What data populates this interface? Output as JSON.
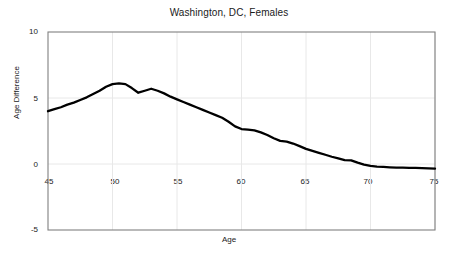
{
  "chart_data": {
    "type": "line",
    "title": "Washington, DC, Females",
    "xlabel": "Age",
    "ylabel": "Age Difference",
    "xlim": [
      45,
      75
    ],
    "ylim": [
      -5,
      10
    ],
    "grid": true,
    "legend": "none",
    "xticks": [
      "45",
      "50",
      "55",
      "60",
      "65",
      "70",
      "75"
    ],
    "xtick_values": [
      45,
      50,
      55,
      60,
      65,
      70,
      75
    ],
    "yticks": [
      "10",
      "5",
      "0",
      "-5"
    ],
    "ytick_values": [
      10,
      5,
      0,
      -5
    ],
    "line_color": "#000000",
    "grid_color": "#e8e8e8",
    "frame_color": "#808080",
    "series": [
      {
        "name": "Age Difference",
        "x": [
          45,
          45.5,
          46,
          46.5,
          47,
          47.5,
          48,
          48.5,
          49,
          49.5,
          50,
          50.5,
          51,
          51.5,
          52,
          52.5,
          53,
          53.5,
          54,
          54.5,
          55,
          55.5,
          56,
          56.5,
          57,
          57.5,
          58,
          58.5,
          59,
          59.5,
          60,
          60.5,
          61,
          61.5,
          62,
          62.5,
          63,
          63.5,
          64,
          64.5,
          65,
          65.5,
          66,
          66.5,
          67,
          67.5,
          68,
          68.5,
          69,
          69.5,
          70,
          70.5,
          71,
          71.5,
          72,
          72.5,
          73,
          73.5,
          74,
          74.5,
          75
        ],
        "y": [
          4.0,
          4.15,
          4.3,
          4.5,
          4.65,
          4.85,
          5.05,
          5.3,
          5.55,
          5.85,
          6.05,
          6.1,
          6.05,
          5.75,
          5.4,
          5.55,
          5.7,
          5.55,
          5.35,
          5.1,
          4.9,
          4.7,
          4.5,
          4.3,
          4.1,
          3.9,
          3.7,
          3.5,
          3.2,
          2.85,
          2.65,
          2.6,
          2.55,
          2.4,
          2.2,
          1.95,
          1.75,
          1.7,
          1.55,
          1.35,
          1.15,
          1.0,
          0.85,
          0.7,
          0.55,
          0.42,
          0.3,
          0.28,
          0.1,
          -0.05,
          -0.15,
          -0.2,
          -0.22,
          -0.25,
          -0.27,
          -0.28,
          -0.29,
          -0.3,
          -0.31,
          -0.33,
          -0.35
        ]
      }
    ]
  }
}
